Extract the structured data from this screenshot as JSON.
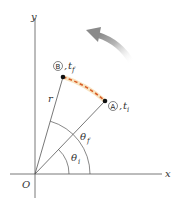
{
  "diagram": {
    "type": "angular-position-diagram",
    "axes": {
      "x_label": "x",
      "y_label": "y",
      "origin_label": "O"
    },
    "radius_label": "r",
    "points": [
      {
        "id": "A",
        "marker": "A",
        "time_label": "t",
        "time_sub": "i"
      },
      {
        "id": "B",
        "marker": "B",
        "time_label": "t",
        "time_sub": "f"
      }
    ],
    "angles": [
      {
        "symbol": "θ",
        "sub": "i"
      },
      {
        "symbol": "θ",
        "sub": "f"
      }
    ],
    "rotation_arrow": "counterclockwise",
    "colors": {
      "axes": "#555555",
      "path_dashed": "#d9602a",
      "path_glow": "#f5d9a8",
      "arrow": "#9a9a9a",
      "points": "#111111"
    }
  }
}
